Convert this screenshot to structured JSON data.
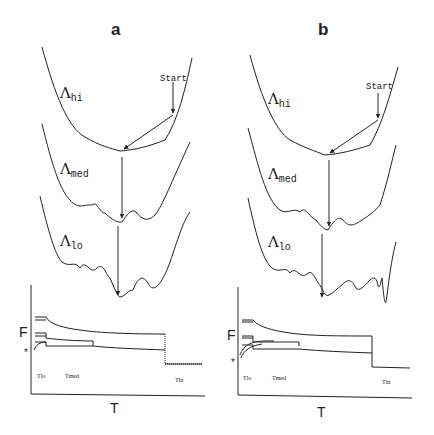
{
  "panels": [
    {
      "letter": "a",
      "landscapes": {
        "hi": {
          "symbol": "Λ",
          "sub": "hi"
        },
        "med": {
          "symbol": "Λ",
          "sub": "med"
        },
        "lo": {
          "symbol": "Λ",
          "sub": "lo"
        }
      },
      "start_label": "Start",
      "plot": {
        "ylabel": "F",
        "xlabel": "T",
        "star": "*",
        "ticks": [
          "Tlo",
          "Tmed",
          "Thi"
        ]
      }
    },
    {
      "letter": "b",
      "landscapes": {
        "hi": {
          "symbol": "Λ",
          "sub": "hi"
        },
        "med": {
          "symbol": "Λ",
          "sub": "med"
        },
        "lo": {
          "symbol": "Λ",
          "sub": "lo"
        }
      },
      "start_label": "Start",
      "plot": {
        "ylabel": "F",
        "xlabel": "T",
        "star": "*",
        "ticks": [
          "Tlo",
          "Tmed",
          "Thi"
        ]
      }
    }
  ],
  "colors": {
    "ink": "#222222",
    "background": "#ffffff"
  }
}
